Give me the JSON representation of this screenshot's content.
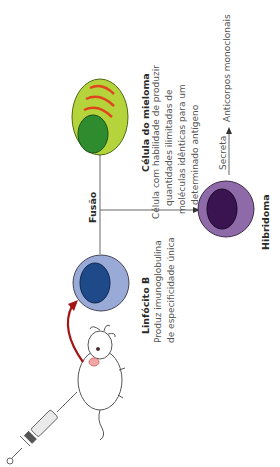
{
  "diagram": {
    "nodes": {
      "mouse": {
        "label": "Camundongo injetado"
      },
      "lymphocyte": {
        "title": "Linfócito B",
        "desc": [
          "Produz imunoglobulina",
          "de especificidade única"
        ],
        "colors": {
          "cell": "#9aaad6",
          "nucleus": "#1f4a8a"
        }
      },
      "myeloma": {
        "title": "Célula do mieloma",
        "desc": [
          "Célula com habilidade de produzir",
          "quantidades ilimitadas de",
          "moléculas idênticas para um",
          "determinado antígeno"
        ],
        "colors": {
          "cell": "#b5d33a",
          "nucleus": "#2e8b2e",
          "stripes": "#e0461e"
        }
      },
      "hybridoma": {
        "title": "Hibridoma",
        "colors": {
          "cell": "#8f6aa8",
          "nucleus": "#3a1450"
        }
      },
      "product": {
        "label": "Anticorpos monoclonais"
      }
    },
    "edges": {
      "fusion": {
        "label": "Fusão"
      },
      "secretes": {
        "label": "Secreta"
      }
    },
    "accent": "#a31515"
  }
}
